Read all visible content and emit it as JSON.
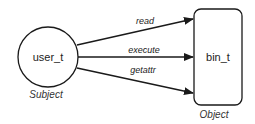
{
  "subject": {
    "label": "user_t",
    "role": "Subject"
  },
  "object": {
    "label": "bin_t",
    "role": "Object"
  },
  "edges": [
    {
      "label": "read"
    },
    {
      "label": "execute"
    },
    {
      "label": "getattr"
    }
  ],
  "colors": {
    "stroke": "#1a1a1a",
    "background": "#ffffff"
  }
}
